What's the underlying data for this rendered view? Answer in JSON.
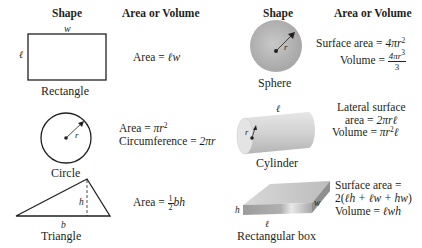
{
  "headers": {
    "left_shape": "Shape",
    "left_formula": "Area or Volume",
    "right_shape": "Shape",
    "right_formula": "Area or Volume"
  },
  "shapes": {
    "rectangle": {
      "name": "Rectangle",
      "labels": {
        "top": "w",
        "side": "ℓ"
      },
      "formulas": {
        "area_prefix": "Area = ",
        "area_expr": "ℓw"
      }
    },
    "circle": {
      "name": "Circle",
      "labels": {
        "radius": "r"
      },
      "formulas": {
        "area_prefix": "Area = ",
        "area_expr": "πr",
        "area_exp": "2",
        "circ_prefix": "Circumference = ",
        "circ_expr": "2πr"
      }
    },
    "triangle": {
      "name": "Triangle",
      "labels": {
        "height": "h",
        "base": "b"
      },
      "formulas": {
        "area_prefix": "Area = ",
        "frac_num": "1",
        "frac_den": "2",
        "area_expr": "bh"
      }
    },
    "sphere": {
      "name": "Sphere",
      "labels": {
        "radius": "r"
      },
      "formulas": {
        "sa_prefix": "Surface area = ",
        "sa_expr": "4πr",
        "sa_exp": "2",
        "vol_prefix": "Volume = ",
        "vol_num": "4πr",
        "vol_num_exp": "3",
        "vol_den": "3"
      }
    },
    "cylinder": {
      "name": "Cylinder",
      "labels": {
        "length": "ℓ",
        "radius": "r"
      },
      "formulas": {
        "lat_line1": "Lateral surface",
        "lat_prefix": "area = ",
        "lat_expr": "2πrℓ",
        "vol_prefix": "Volume = ",
        "vol_expr1": "πr",
        "vol_exp": "2",
        "vol_expr2": "ℓ"
      }
    },
    "box": {
      "name": "Rectangular box",
      "labels": {
        "height": "h",
        "width": "w",
        "length": "ℓ"
      },
      "formulas": {
        "sa_line1": "Surface area =",
        "sa_line2_a": "2(",
        "sa_line2_b": "ℓh + ℓw + hw",
        "sa_line2_c": ")",
        "vol_prefix": "Volume = ",
        "vol_expr": "ℓwh"
      }
    }
  },
  "colors": {
    "stroke": "#231f20",
    "sphere_fill": "#b8b8b8",
    "cylinder_fill": "#d6d6d6",
    "box_fill": "#c4c4c4"
  }
}
